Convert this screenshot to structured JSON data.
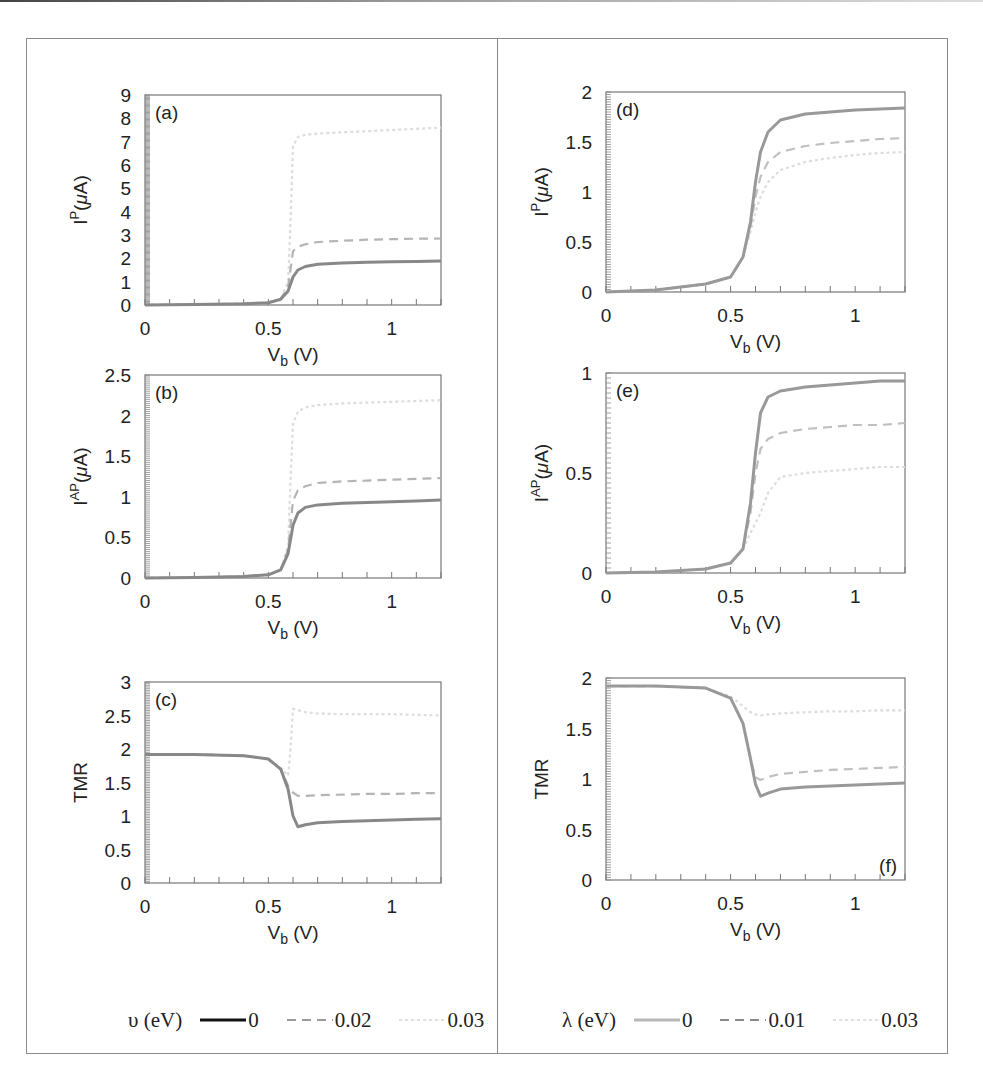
{
  "chart_data": [
    {
      "id": "a",
      "type": "line",
      "panel_label": "(a)",
      "xlabel": "V_b (V)",
      "ylabel": "I^P(μA)",
      "xlim": [
        0,
        1.2
      ],
      "ylim": [
        0,
        9
      ],
      "xticks": [
        0,
        0.5,
        1
      ],
      "yticks": [
        0,
        1,
        2,
        3,
        4,
        5,
        6,
        7,
        8,
        9
      ],
      "legend_param": "υ (eV)",
      "series": [
        {
          "name": "0",
          "style": "solid",
          "color": "#888888",
          "x": [
            0,
            0.2,
            0.4,
            0.5,
            0.55,
            0.58,
            0.6,
            0.62,
            0.65,
            0.7,
            0.8,
            0.9,
            1.0,
            1.1,
            1.2
          ],
          "y": [
            0,
            0.02,
            0.05,
            0.1,
            0.25,
            0.6,
            1.2,
            1.5,
            1.65,
            1.75,
            1.8,
            1.83,
            1.85,
            1.87,
            1.88
          ]
        },
        {
          "name": "0.02",
          "style": "dashed",
          "color": "#b4b4b4",
          "x": [
            0,
            0.2,
            0.4,
            0.5,
            0.55,
            0.58,
            0.6,
            0.62,
            0.65,
            0.7,
            0.8,
            0.9,
            1.0,
            1.1,
            1.2
          ],
          "y": [
            0,
            0.02,
            0.05,
            0.1,
            0.25,
            0.8,
            2.3,
            2.5,
            2.6,
            2.7,
            2.75,
            2.8,
            2.82,
            2.84,
            2.85
          ]
        },
        {
          "name": "0.03",
          "style": "dotted",
          "color": "#dcdcdc",
          "x": [
            0,
            0.2,
            0.4,
            0.5,
            0.55,
            0.58,
            0.59,
            0.6,
            0.62,
            0.65,
            0.7,
            0.8,
            0.9,
            1.0,
            1.1,
            1.2
          ],
          "y": [
            0,
            0.02,
            0.05,
            0.1,
            0.25,
            1.0,
            3.5,
            6.8,
            7.2,
            7.3,
            7.35,
            7.4,
            7.45,
            7.5,
            7.55,
            7.6
          ]
        }
      ]
    },
    {
      "id": "b",
      "type": "line",
      "panel_label": "(b)",
      "xlabel": "V_b (V)",
      "ylabel": "I^AP(μA)",
      "xlim": [
        0,
        1.2
      ],
      "ylim": [
        0,
        2.5
      ],
      "xticks": [
        0,
        0.5,
        1
      ],
      "yticks": [
        0,
        0.5,
        1,
        1.5,
        2,
        2.5
      ],
      "legend_param": "υ (eV)",
      "series": [
        {
          "name": "0",
          "style": "solid",
          "color": "#888888",
          "x": [
            0,
            0.2,
            0.4,
            0.5,
            0.55,
            0.58,
            0.6,
            0.62,
            0.65,
            0.7,
            0.8,
            0.9,
            1.0,
            1.1,
            1.2
          ],
          "y": [
            0,
            0.005,
            0.02,
            0.04,
            0.1,
            0.3,
            0.65,
            0.8,
            0.87,
            0.9,
            0.92,
            0.93,
            0.94,
            0.95,
            0.96
          ]
        },
        {
          "name": "0.02",
          "style": "dashed",
          "color": "#b4b4b4",
          "x": [
            0,
            0.2,
            0.4,
            0.5,
            0.55,
            0.58,
            0.6,
            0.62,
            0.65,
            0.7,
            0.8,
            0.9,
            1.0,
            1.1,
            1.2
          ],
          "y": [
            0,
            0.005,
            0.02,
            0.04,
            0.1,
            0.35,
            0.95,
            1.08,
            1.13,
            1.17,
            1.19,
            1.2,
            1.21,
            1.22,
            1.23
          ]
        },
        {
          "name": "0.03",
          "style": "dotted",
          "color": "#dcdcdc",
          "x": [
            0,
            0.2,
            0.4,
            0.5,
            0.55,
            0.58,
            0.59,
            0.6,
            0.62,
            0.65,
            0.7,
            0.8,
            0.9,
            1.0,
            1.1,
            1.2
          ],
          "y": [
            0,
            0.005,
            0.02,
            0.04,
            0.1,
            0.4,
            1.2,
            1.9,
            2.05,
            2.1,
            2.13,
            2.15,
            2.16,
            2.17,
            2.18,
            2.19
          ]
        }
      ]
    },
    {
      "id": "c",
      "type": "line",
      "panel_label": "(c)",
      "xlabel": "V_b (V)",
      "ylabel": "TMR",
      "xlim": [
        0,
        1.2
      ],
      "ylim": [
        0,
        3
      ],
      "xticks": [
        0,
        0.5,
        1
      ],
      "yticks": [
        0,
        0.5,
        1,
        1.5,
        2,
        2.5,
        3
      ],
      "legend_param": "υ (eV)",
      "series": [
        {
          "name": "0",
          "style": "solid",
          "color": "#888888",
          "x": [
            0,
            0.2,
            0.4,
            0.5,
            0.55,
            0.58,
            0.6,
            0.62,
            0.65,
            0.7,
            0.8,
            0.9,
            1.0,
            1.1,
            1.2
          ],
          "y": [
            1.92,
            1.92,
            1.9,
            1.85,
            1.7,
            1.4,
            1.0,
            0.84,
            0.87,
            0.9,
            0.92,
            0.93,
            0.94,
            0.95,
            0.96
          ]
        },
        {
          "name": "0.02",
          "style": "dashed",
          "color": "#b4b4b4",
          "x": [
            0,
            0.2,
            0.4,
            0.5,
            0.55,
            0.58,
            0.6,
            0.62,
            0.65,
            0.7,
            0.8,
            0.9,
            1.0,
            1.1,
            1.2
          ],
          "y": [
            1.92,
            1.92,
            1.9,
            1.85,
            1.7,
            1.45,
            1.35,
            1.3,
            1.3,
            1.31,
            1.32,
            1.33,
            1.33,
            1.34,
            1.34
          ]
        },
        {
          "name": "0.03",
          "style": "dotted",
          "color": "#dcdcdc",
          "x": [
            0,
            0.2,
            0.4,
            0.5,
            0.55,
            0.58,
            0.59,
            0.6,
            0.62,
            0.65,
            0.7,
            0.8,
            0.9,
            1.0,
            1.1,
            1.2
          ],
          "y": [
            1.92,
            1.92,
            1.9,
            1.85,
            1.72,
            1.6,
            2.0,
            2.6,
            2.58,
            2.55,
            2.53,
            2.52,
            2.52,
            2.52,
            2.51,
            2.5
          ]
        }
      ]
    },
    {
      "id": "d",
      "type": "line",
      "panel_label": "(d)",
      "xlabel": "V_b (V)",
      "ylabel": "I^P(μA)",
      "xlim": [
        0,
        1.2
      ],
      "ylim": [
        0,
        2
      ],
      "xticks": [
        0,
        0.5,
        1
      ],
      "yticks": [
        0,
        0.5,
        1,
        1.5,
        2
      ],
      "legend_param": "λ (eV)",
      "series": [
        {
          "name": "0",
          "style": "solid",
          "color": "#999999",
          "x": [
            0,
            0.2,
            0.4,
            0.5,
            0.55,
            0.58,
            0.6,
            0.62,
            0.65,
            0.7,
            0.8,
            0.9,
            1.0,
            1.1,
            1.2
          ],
          "y": [
            0,
            0.02,
            0.08,
            0.15,
            0.35,
            0.7,
            1.1,
            1.4,
            1.6,
            1.72,
            1.78,
            1.8,
            1.82,
            1.83,
            1.84
          ]
        },
        {
          "name": "0.01",
          "style": "dashed",
          "color": "#c0c0c0",
          "x": [
            0,
            0.2,
            0.4,
            0.5,
            0.55,
            0.58,
            0.6,
            0.62,
            0.65,
            0.7,
            0.8,
            0.9,
            1.0,
            1.1,
            1.2
          ],
          "y": [
            0,
            0.02,
            0.08,
            0.15,
            0.35,
            0.65,
            0.95,
            1.15,
            1.3,
            1.4,
            1.46,
            1.49,
            1.51,
            1.53,
            1.54
          ]
        },
        {
          "name": "0.03",
          "style": "dotted",
          "color": "#dcdcdc",
          "x": [
            0,
            0.2,
            0.4,
            0.5,
            0.55,
            0.58,
            0.6,
            0.62,
            0.65,
            0.7,
            0.8,
            0.9,
            1.0,
            1.1,
            1.2
          ],
          "y": [
            0,
            0.02,
            0.08,
            0.15,
            0.35,
            0.6,
            0.8,
            0.95,
            1.1,
            1.22,
            1.3,
            1.34,
            1.37,
            1.39,
            1.4
          ]
        }
      ]
    },
    {
      "id": "e",
      "type": "line",
      "panel_label": "(e)",
      "xlabel": "V_b (V)",
      "ylabel": "I^AP(μA)",
      "xlim": [
        0,
        1.2
      ],
      "ylim": [
        0,
        1
      ],
      "xticks": [
        0,
        0.5,
        1
      ],
      "yticks": [
        0,
        0.5,
        1
      ],
      "legend_param": "λ (eV)",
      "series": [
        {
          "name": "0",
          "style": "solid",
          "color": "#999999",
          "x": [
            0,
            0.2,
            0.4,
            0.5,
            0.55,
            0.58,
            0.6,
            0.62,
            0.65,
            0.7,
            0.8,
            0.9,
            1.0,
            1.1,
            1.2
          ],
          "y": [
            0,
            0.005,
            0.02,
            0.05,
            0.12,
            0.35,
            0.6,
            0.8,
            0.88,
            0.91,
            0.93,
            0.94,
            0.95,
            0.96,
            0.96
          ]
        },
        {
          "name": "0.01",
          "style": "dashed",
          "color": "#c0c0c0",
          "x": [
            0,
            0.2,
            0.4,
            0.5,
            0.55,
            0.58,
            0.6,
            0.62,
            0.65,
            0.7,
            0.8,
            0.9,
            1.0,
            1.1,
            1.2
          ],
          "y": [
            0,
            0.005,
            0.02,
            0.05,
            0.12,
            0.3,
            0.5,
            0.62,
            0.67,
            0.7,
            0.72,
            0.73,
            0.74,
            0.74,
            0.75
          ]
        },
        {
          "name": "0.03",
          "style": "dotted",
          "color": "#dcdcdc",
          "x": [
            0,
            0.2,
            0.4,
            0.5,
            0.55,
            0.58,
            0.6,
            0.62,
            0.65,
            0.7,
            0.8,
            0.9,
            1.0,
            1.1,
            1.2
          ],
          "y": [
            0,
            0.005,
            0.02,
            0.05,
            0.12,
            0.2,
            0.25,
            0.3,
            0.4,
            0.48,
            0.5,
            0.51,
            0.52,
            0.53,
            0.53
          ]
        }
      ]
    },
    {
      "id": "f",
      "type": "line",
      "panel_label": "(f)",
      "xlabel": "V_b (V)",
      "ylabel": "TMR",
      "xlim": [
        0,
        1.2
      ],
      "ylim": [
        0,
        2
      ],
      "xticks": [
        0,
        0.5,
        1
      ],
      "yticks": [
        0,
        0.5,
        1,
        1.5,
        2
      ],
      "legend_param": "λ (eV)",
      "series": [
        {
          "name": "0",
          "style": "solid",
          "color": "#999999",
          "x": [
            0,
            0.2,
            0.4,
            0.5,
            0.55,
            0.58,
            0.6,
            0.62,
            0.65,
            0.7,
            0.8,
            0.9,
            1.0,
            1.1,
            1.2
          ],
          "y": [
            1.92,
            1.92,
            1.9,
            1.8,
            1.55,
            1.2,
            0.95,
            0.83,
            0.86,
            0.9,
            0.92,
            0.93,
            0.94,
            0.95,
            0.96
          ]
        },
        {
          "name": "0.01",
          "style": "dashed",
          "color": "#c0c0c0",
          "x": [
            0,
            0.2,
            0.4,
            0.5,
            0.55,
            0.58,
            0.6,
            0.62,
            0.65,
            0.7,
            0.8,
            0.9,
            1.0,
            1.1,
            1.2
          ],
          "y": [
            1.92,
            1.92,
            1.9,
            1.8,
            1.55,
            1.2,
            1.02,
            0.99,
            1.02,
            1.05,
            1.07,
            1.09,
            1.1,
            1.11,
            1.12
          ]
        },
        {
          "name": "0.03",
          "style": "dotted",
          "color": "#dcdcdc",
          "x": [
            0,
            0.2,
            0.4,
            0.5,
            0.55,
            0.58,
            0.6,
            0.62,
            0.65,
            0.7,
            0.8,
            0.9,
            1.0,
            1.1,
            1.2
          ],
          "y": [
            1.92,
            1.92,
            1.9,
            1.82,
            1.72,
            1.66,
            1.64,
            1.63,
            1.64,
            1.65,
            1.66,
            1.67,
            1.67,
            1.68,
            1.68
          ]
        }
      ]
    }
  ],
  "legends": {
    "left": {
      "title": "υ (eV)",
      "entries": [
        {
          "label": "0",
          "style": "solid",
          "color": "#111111"
        },
        {
          "label": "0.02",
          "style": "dashed",
          "color": "#9a9a9a"
        },
        {
          "label": "0.03",
          "style": "dotted",
          "color": "#dddddd"
        }
      ]
    },
    "right": {
      "title": "λ (eV)",
      "entries": [
        {
          "label": "0",
          "style": "solid",
          "color": "#b8b8b8"
        },
        {
          "label": "0.01",
          "style": "dashed",
          "color": "#8a8a8a"
        },
        {
          "label": "0.03",
          "style": "dotted",
          "color": "#dddddd"
        }
      ]
    }
  },
  "layout": {
    "panels": {
      "a": {
        "left": 145,
        "top": 95,
        "width": 296,
        "height": 210
      },
      "b": {
        "left": 145,
        "top": 375,
        "width": 296,
        "height": 203
      },
      "c": {
        "left": 145,
        "top": 682,
        "width": 296,
        "height": 201
      },
      "d": {
        "left": 606,
        "top": 92,
        "width": 299,
        "height": 200
      },
      "e": {
        "left": 606,
        "top": 373,
        "width": 299,
        "height": 200
      },
      "f": {
        "left": 606,
        "top": 678,
        "width": 299,
        "height": 202
      }
    }
  }
}
